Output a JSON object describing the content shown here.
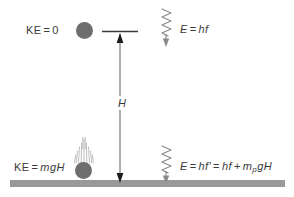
{
  "diagram": {
    "colors": {
      "ink": "#3a3a3a",
      "ball": "#6e6e6e",
      "ground": "#999999",
      "background": "#ffffff"
    },
    "labels": {
      "ke_top": {
        "text": "KE = 0",
        "lhs": "KE",
        "operator": "=",
        "rhs": "0"
      },
      "ke_bottom": {
        "text": "KE = mgH",
        "lhs": "KE",
        "operator": "=",
        "rhs": "mgH"
      },
      "energy_top": {
        "text": "E = hf",
        "lhs": "E",
        "operator": "=",
        "rhs": "hf"
      },
      "energy_bottom": {
        "text": "E = hf' = hf + mpgH",
        "lhs": "E",
        "operator_1": "=",
        "term_1": "hf'",
        "operator_2": "=",
        "term_2": "hf",
        "operator_3": "+",
        "term_3_base": "m",
        "term_3_subscript": "p",
        "term_3_tail": "gH"
      },
      "height": {
        "text": "H"
      }
    },
    "elements": {
      "ball_top": "ball-at-rest",
      "ball_bottom": "ball-at-ground",
      "motion_lines": "falling-motion-streaks",
      "ground": "ground-surface",
      "height_arrow": "height-dimension-arrow",
      "photon_top": "photon-wave-emitted",
      "photon_bottom": "photon-wave-received"
    }
  }
}
